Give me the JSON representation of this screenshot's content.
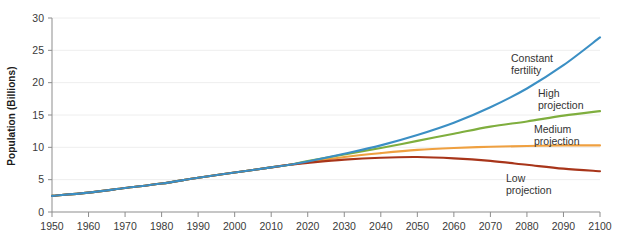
{
  "chart_data": {
    "type": "line",
    "title": "",
    "xlabel": "",
    "ylabel": "Population (Billions)",
    "xlim": [
      1950,
      2100
    ],
    "ylim": [
      0,
      30
    ],
    "grid": "horizontal",
    "legend_position": "inline-right",
    "xticks": [
      1950,
      1960,
      1970,
      1980,
      1990,
      2000,
      2010,
      2020,
      2030,
      2040,
      2050,
      2060,
      2070,
      2080,
      2090,
      2100
    ],
    "yticks": [
      0,
      5,
      10,
      15,
      20,
      25,
      30
    ],
    "xtick_labels": [
      "1950",
      "1960",
      "1970",
      "1980",
      "1990",
      "2000",
      "2010",
      "2020",
      "2030",
      "2040",
      "2050",
      "2060",
      "2070",
      "2080",
      "2090",
      "2100"
    ],
    "ytick_labels": [
      "0",
      "5",
      "10",
      "15",
      "20",
      "25",
      "30"
    ],
    "series": [
      {
        "name": "Constant fertility",
        "label_lines": [
          "Constant",
          "fertility"
        ],
        "color": "#3b8fc4",
        "x": [
          1950,
          1960,
          1970,
          1980,
          1990,
          2000,
          2010,
          2015,
          2020,
          2030,
          2040,
          2050,
          2060,
          2070,
          2080,
          2090,
          2100
        ],
        "values": [
          2.5,
          3.0,
          3.7,
          4.4,
          5.3,
          6.1,
          6.9,
          7.3,
          7.8,
          9.0,
          10.3,
          11.9,
          13.8,
          16.2,
          19.1,
          22.7,
          27.0
        ]
      },
      {
        "name": "High projection",
        "label_lines": [
          "High",
          "projection"
        ],
        "color": "#7fae3e",
        "x": [
          1950,
          1960,
          1970,
          1980,
          1990,
          2000,
          2010,
          2015,
          2020,
          2030,
          2040,
          2050,
          2060,
          2070,
          2080,
          2090,
          2100
        ],
        "values": [
          2.5,
          3.0,
          3.7,
          4.4,
          5.3,
          6.1,
          6.9,
          7.3,
          7.9,
          8.9,
          9.9,
          11.0,
          12.1,
          13.2,
          14.0,
          14.9,
          15.6
        ]
      },
      {
        "name": "Medium projection",
        "label_lines": [
          "Medium",
          "projection"
        ],
        "color": "#efa040",
        "x": [
          1950,
          1960,
          1970,
          1980,
          1990,
          2000,
          2010,
          2015,
          2020,
          2030,
          2040,
          2050,
          2060,
          2070,
          2080,
          2090,
          2100
        ],
        "values": [
          2.5,
          3.0,
          3.7,
          4.4,
          5.3,
          6.1,
          6.9,
          7.3,
          7.7,
          8.5,
          9.1,
          9.6,
          9.9,
          10.1,
          10.2,
          10.3,
          10.3
        ]
      },
      {
        "name": "Low projection",
        "label_lines": [
          "Low",
          "projection"
        ],
        "color": "#a8351a",
        "x": [
          1950,
          1960,
          1970,
          1980,
          1990,
          2000,
          2010,
          2015,
          2020,
          2030,
          2040,
          2050,
          2060,
          2070,
          2080,
          2090,
          2100
        ],
        "values": [
          2.5,
          3.0,
          3.7,
          4.4,
          5.3,
          6.1,
          6.9,
          7.3,
          7.6,
          8.1,
          8.4,
          8.5,
          8.3,
          7.9,
          7.3,
          6.7,
          6.3
        ]
      }
    ]
  }
}
